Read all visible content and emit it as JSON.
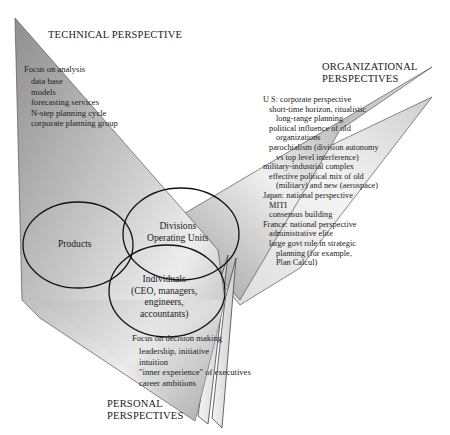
{
  "diagram": {
    "technical": {
      "title": "TECHNICAL PERSPECTIVE",
      "heading": "Focus on analysis",
      "items": [
        "data base",
        "models",
        "forecasting services",
        "N-step planning cycle",
        "corporate planning group"
      ]
    },
    "organizational": {
      "title_line1": "ORGANIZATIONAL",
      "title_line2": "PERSPECTIVES",
      "lines": [
        "U S:  corporate perspective",
        "short-time horizon, ritualistic",
        "long-range planning",
        "political influence of old",
        "organizations",
        "parochialism (division autonomy",
        "vs top level interference)",
        "military-industrial complex",
        "effective political mix of old",
        "(military) and new (aerospace)",
        "Japan:  national perspective",
        "MITI",
        "consensus building",
        "France:  national perspective",
        "administrative elite",
        "large govt role in strategic",
        "planning (for example,",
        "Plan Calcul)"
      ]
    },
    "personal": {
      "title_line1": "PERSONAL",
      "title_line2": "PERSPECTIVES",
      "heading": "Focus on decision making",
      "items": [
        "leadership, initiative",
        "intuition",
        "\"inner experience\" of executives",
        "career ambitions"
      ]
    },
    "circles": {
      "products": "Products",
      "divisions_line1": "Divisions",
      "divisions_line2": "Operating Units",
      "individuals_line1": "Individuals",
      "individuals_line2": "(CEO, managers,",
      "individuals_line3": "engineers,",
      "individuals_line4": "accountants)"
    }
  }
}
